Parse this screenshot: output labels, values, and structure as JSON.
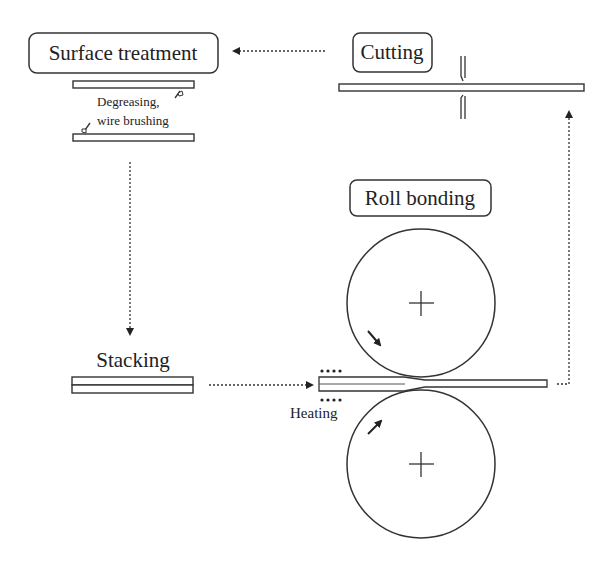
{
  "diagram": {
    "steps": {
      "surface_treatment": {
        "label": "Surface treatment",
        "annotation_line1": "Degreasing,",
        "annotation_line2": "wire brushing"
      },
      "cutting": {
        "label": "Cutting"
      },
      "stacking": {
        "label": "Stacking"
      },
      "roll_bonding": {
        "label": "Roll bonding",
        "heating_label": "Heating"
      }
    },
    "flow": [
      {
        "from": "Stacking",
        "to": "Roll bonding"
      },
      {
        "from": "Roll bonding",
        "to": "Cutting"
      },
      {
        "from": "Cutting",
        "to": "Surface treatment"
      },
      {
        "from": "Surface treatment",
        "to": "Stacking"
      }
    ],
    "colors": {
      "line": "#333333",
      "background": "#ffffff"
    }
  }
}
